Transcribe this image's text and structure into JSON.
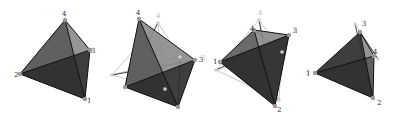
{
  "figure": {
    "colors": {
      "face_dark": "#2e2e2e",
      "face_mid": "#5a5a5a",
      "face_light": "#8a8a8a",
      "edge": "#111111",
      "ghost_edge": "#c8c8c8",
      "vertex": "#9a9a9a",
      "label": "#333333"
    },
    "panels": [
      {
        "id": "tetra-1",
        "vertices": {
          "1": [
            85,
            99
          ],
          "2": [
            20,
            74
          ],
          "3": [
            90,
            50
          ],
          "4": [
            65,
            20
          ]
        },
        "labels": [
          {
            "text": "4",
            "x": 62,
            "y": 16
          },
          {
            "text": "3",
            "x": 91,
            "y": 53
          },
          {
            "text": "2",
            "x": 14,
            "y": 77
          },
          {
            "text": "1",
            "x": 87,
            "y": 103
          }
        ],
        "ghost_labels": []
      },
      {
        "id": "tetra-2",
        "vertices": {
          "1": [
            178,
            107
          ],
          "2": [
            125,
            87
          ],
          "3": [
            195,
            60
          ],
          "4": [
            139,
            19
          ]
        },
        "ghost_vertices": {
          "a": [
            158,
            23
          ],
          "b": [
            112,
            75
          ],
          "c": [
            165,
            89
          ],
          "d": [
            180,
            57
          ]
        },
        "labels": [
          {
            "text": "4",
            "x": 136,
            "y": 15
          },
          {
            "text": "3",
            "x": 199,
            "y": 62
          }
        ],
        "ghost_labels": [
          {
            "text": "4",
            "x": 156,
            "y": 18
          }
        ]
      },
      {
        "id": "tetra-3",
        "vertices": {
          "1": [
            220,
            62
          ],
          "2": [
            275,
            106
          ],
          "3": [
            289,
            35
          ],
          "4": [
            254,
            30
          ]
        },
        "ghost_vertices": {
          "a": [
            259,
            20
          ],
          "b": [
            216,
            70
          ],
          "c": [
            282,
            52
          ],
          "d": [
            279,
            100
          ]
        },
        "labels": [
          {
            "text": "3",
            "x": 293,
            "y": 33
          },
          {
            "text": "4",
            "x": 250,
            "y": 31
          },
          {
            "text": "1",
            "x": 213,
            "y": 64
          },
          {
            "text": "2",
            "x": 277,
            "y": 112
          }
        ],
        "ghost_labels": [
          {
            "text": "4",
            "x": 258,
            "y": 15
          },
          {
            "text": "3",
            "x": 201,
            "y": 60
          },
          {
            "text": "1",
            "x": 306,
            "y": 74
          }
        ]
      },
      {
        "id": "tetra-4",
        "vertices": {
          "1": [
            315,
            73
          ],
          "2": [
            373,
            98
          ],
          "3": [
            360,
            32
          ],
          "4": [
            374,
            56
          ]
        },
        "ghost_vertices": {
          "a": [
            355,
            24
          ],
          "b": [
            378,
            59
          ]
        },
        "labels": [
          {
            "text": "3",
            "x": 362,
            "y": 26
          },
          {
            "text": "4",
            "x": 373,
            "y": 54
          },
          {
            "text": "1",
            "x": 306,
            "y": 76
          },
          {
            "text": "2",
            "x": 377,
            "y": 105
          }
        ],
        "ghost_labels": [
          {
            "text": "3",
            "x": 293,
            "y": 32
          }
        ]
      }
    ]
  }
}
